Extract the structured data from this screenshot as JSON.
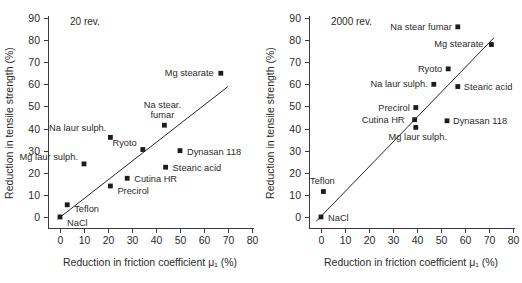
{
  "figure": {
    "axis_x_label": "Reduction in friction coefficient μ₁ (%)",
    "axis_y_label": "Reduction in tensile strength (%)"
  },
  "chart_data": [
    {
      "type": "scatter",
      "title": "20 rev.",
      "xlabel": "Reduction in friction coefficient μ₁ (%)",
      "ylabel": "Reduction in tensile strength (%)",
      "xlim": [
        -5,
        80
      ],
      "ylim": [
        -5,
        90
      ],
      "xticks": [
        0,
        10,
        20,
        30,
        40,
        50,
        60,
        70,
        80
      ],
      "yticks": [
        0,
        10,
        20,
        30,
        40,
        50,
        60,
        70,
        80,
        90
      ],
      "grid": false,
      "legend": "none",
      "trendline": {
        "x": [
          -1,
          70
        ],
        "y": [
          -1,
          59
        ]
      },
      "points": [
        {
          "label": "NaCl",
          "x": 0,
          "y": 0,
          "label_dx": 7,
          "label_dy": 9,
          "anchor": "start"
        },
        {
          "label": "Teflon",
          "x": 3,
          "y": 5.5,
          "label_dx": 7,
          "label_dy": 7,
          "anchor": "start"
        },
        {
          "label": "Mg laur sulph.",
          "x": 10,
          "y": 24,
          "label_dx": -6,
          "label_dy": -4,
          "anchor": "end"
        },
        {
          "label": "Precirol",
          "x": 21,
          "y": 14,
          "label_dx": 7,
          "label_dy": 8,
          "anchor": "start"
        },
        {
          "label": "Na laur sulph.",
          "x": 21,
          "y": 36,
          "label_dx": -4,
          "label_dy": -6,
          "anchor": "end"
        },
        {
          "label": "Cutina HR",
          "x": 28,
          "y": 17.5,
          "label_dx": 7,
          "label_dy": 4,
          "anchor": "start"
        },
        {
          "label": "Ryoto",
          "x": 34.5,
          "y": 30.5,
          "label_dx": -6,
          "label_dy": -4,
          "anchor": "end"
        },
        {
          "label": "Na stear.",
          "x": 43.5,
          "y": 41.5,
          "label_dx": -2,
          "label_dy": -17,
          "anchor": "middle"
        },
        {
          "label": "fumar",
          "x": 43.5,
          "y": 41.5,
          "label_dx": -2,
          "label_dy": -7,
          "anchor": "middle",
          "is_continuation": true
        },
        {
          "label": "Stearic acid",
          "x": 44,
          "y": 22.5,
          "label_dx": 7,
          "label_dy": 4,
          "anchor": "start"
        },
        {
          "label": "Dynasan 118",
          "x": 50,
          "y": 30,
          "label_dx": 7,
          "label_dy": 4,
          "anchor": "start"
        },
        {
          "label": "Mg stearate",
          "x": 67,
          "y": 65,
          "label_dx": -7,
          "label_dy": 3,
          "anchor": "end"
        }
      ]
    },
    {
      "type": "scatter",
      "title": "2000 rev.",
      "xlabel": "Reduction in friction coefficient μ₁ (%)",
      "ylabel": "Reduction in tensile strength (%)",
      "xlim": [
        -5,
        80
      ],
      "ylim": [
        -5,
        90
      ],
      "xticks": [
        0,
        10,
        20,
        30,
        40,
        50,
        60,
        70,
        80
      ],
      "yticks": [
        0,
        10,
        20,
        30,
        40,
        50,
        60,
        70,
        80,
        90
      ],
      "grid": false,
      "legend": "none",
      "trendline": {
        "x": [
          -2,
          72
        ],
        "y": [
          -2,
          81
        ]
      },
      "points": [
        {
          "label": "NaCl",
          "x": 0,
          "y": 0,
          "label_dx": 7,
          "label_dy": 4,
          "anchor": "start"
        },
        {
          "label": "Teflon",
          "x": 1,
          "y": 11.5,
          "label_dx": -1,
          "label_dy": -8,
          "anchor": "middle"
        },
        {
          "label": "Cutina HR",
          "x": 39,
          "y": 44,
          "label_dx": -10,
          "label_dy": 3,
          "anchor": "end"
        },
        {
          "label": "Mg laur sulph.",
          "x": 39.5,
          "y": 40.5,
          "label_dx": 2,
          "label_dy": 13,
          "anchor": "middle"
        },
        {
          "label": "Precirol",
          "x": 39.5,
          "y": 49.5,
          "label_dx": -6,
          "label_dy": 3,
          "anchor": "end"
        },
        {
          "label": "Na laur sulph.",
          "x": 47,
          "y": 60,
          "label_dx": -6,
          "label_dy": 3,
          "anchor": "end"
        },
        {
          "label": "Dynasan 118",
          "x": 52.5,
          "y": 43.5,
          "label_dx": 6,
          "label_dy": 3,
          "anchor": "start"
        },
        {
          "label": "Ryoto",
          "x": 53,
          "y": 67,
          "label_dx": -6,
          "label_dy": 3,
          "anchor": "end"
        },
        {
          "label": "Stearic acid",
          "x": 57,
          "y": 59,
          "label_dx": 6,
          "label_dy": 3,
          "anchor": "start"
        },
        {
          "label": "Na stear fumar",
          "x": 57,
          "y": 86,
          "label_dx": -6,
          "label_dy": 3,
          "anchor": "end"
        },
        {
          "label": "Mg stearate",
          "x": 71,
          "y": 78,
          "label_dx": -8,
          "label_dy": 2,
          "anchor": "end"
        }
      ]
    }
  ]
}
